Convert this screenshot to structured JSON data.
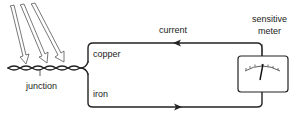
{
  "diagram": {
    "labels": {
      "current": "current",
      "copper": "copper",
      "iron": "iron",
      "junction": "junction",
      "meter_line1": "sensitive",
      "meter_line2": "meter"
    },
    "incoming_arrows": 3,
    "current_direction": {
      "copper_wire": "toward junction (leftward)",
      "iron_wire": "toward meter (rightward)"
    },
    "colors": {
      "ink": "#222222",
      "background": "#ffffff"
    }
  }
}
